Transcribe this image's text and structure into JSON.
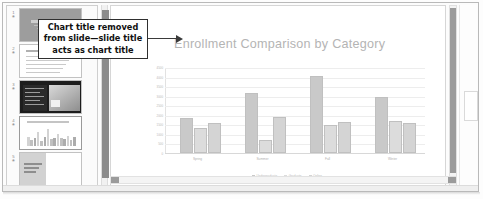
{
  "annotation": {
    "text": "Chart title removed from slide—slide title acts as chart title",
    "arrow_icon": "right-arrow-icon"
  },
  "slide": {
    "title": "Enrollment Comparison by Category"
  },
  "thumbnails": [
    {
      "number": "1",
      "icon": "animation-star-icon",
      "kind": "title-slide"
    },
    {
      "number": "2",
      "icon": "animation-star-icon",
      "kind": "text-slide"
    },
    {
      "number": "3",
      "icon": "animation-star-icon",
      "kind": "picture-slide"
    },
    {
      "number": "4",
      "icon": "animation-star-icon",
      "kind": "chart-slide"
    },
    {
      "number": "5",
      "icon": "animation-star-icon",
      "kind": "text-slide"
    }
  ],
  "thumb5_text": "Findings and Recommendations Summary",
  "chart_data": {
    "type": "bar",
    "title": "Enrollment Comparison by Category",
    "xlabel": "",
    "ylabel": "",
    "categories": [
      "Spring",
      "Summer",
      "Fall",
      "Winter"
    ],
    "series": [
      {
        "name": "Undergraduate",
        "color": "#c9c9c9",
        "values": [
          1750,
          3050,
          3950,
          2850
        ]
      },
      {
        "name": "Graduate",
        "color": "#dcdcdc",
        "values": [
          1200,
          600,
          1350,
          1550
        ]
      },
      {
        "name": "Online",
        "color": "#d4d4d4",
        "values": [
          1450,
          1800,
          1500,
          1450
        ]
      }
    ],
    "ylim": [
      0,
      4500
    ],
    "yticks": [
      "0",
      "500",
      "1000",
      "1500",
      "2000",
      "2500",
      "3000",
      "3500",
      "4000",
      "4500"
    ],
    "grid": true,
    "legend": "bottom"
  },
  "scrollbars": {
    "vertical_left": "pane-splitter-scrollbar",
    "vertical_right": "slide-vertical-scrollbar",
    "horizontal": "slide-horizontal-scrollbar"
  }
}
